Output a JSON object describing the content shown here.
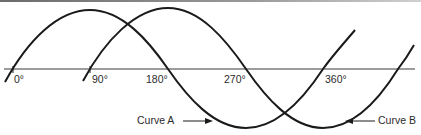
{
  "diagram": {
    "type": "phase-shifted sine waves",
    "axis_labels": [
      "0°",
      "90°",
      "180°",
      "270°",
      "360°"
    ],
    "curves": [
      {
        "name": "Curve A",
        "phase_start_deg": 0
      },
      {
        "name": "Curve B",
        "phase_start_deg": 90
      }
    ],
    "labels": {
      "tick_0": "0°",
      "tick_90": "90°",
      "tick_180": "180°",
      "tick_270": "270°",
      "tick_360": "360°",
      "curve_a": "Curve A",
      "curve_b": "Curve B"
    },
    "colors": {
      "line": "#1a1a1a",
      "text": "#2a2a2a",
      "background": "#ffffff"
    }
  }
}
